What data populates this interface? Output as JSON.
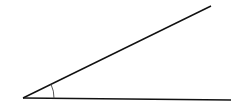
{
  "diagram": {
    "type": "angle",
    "vertex": [
      23,
      98
    ],
    "ray_upper_end": [
      211,
      6
    ],
    "ray_lower_end": [
      231,
      100
    ],
    "arc_radius": 31,
    "stroke_color": "#111111",
    "arc_color": "#444444",
    "labels": []
  }
}
